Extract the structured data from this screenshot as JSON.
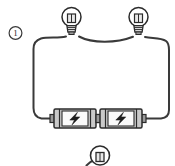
{
  "figure": {
    "kind": "circuit-diagram",
    "title": "",
    "item_number": "1",
    "background_color": "#ffffff",
    "wire_color": "#3a3a3a",
    "outline_color": "#2b2b2b",
    "body_fill": "#c9c9c9",
    "label_fill": "#f2f2f2",
    "cap_fill": "#9a9a9a"
  },
  "question_marker": {
    "label": "1",
    "shape": "circled-number"
  },
  "components": [
    {
      "id": "bulb-left",
      "type": "light-bulb",
      "icon": "light-bulb-icon",
      "label": "",
      "position": "top-left"
    },
    {
      "id": "bulb-right",
      "type": "light-bulb",
      "icon": "light-bulb-icon",
      "label": "",
      "position": "top-right"
    },
    {
      "id": "battery-left",
      "type": "battery",
      "icon": "battery-bolt-icon",
      "label": "",
      "position": "bottom-center-left"
    },
    {
      "id": "battery-right",
      "type": "battery",
      "icon": "battery-bolt-icon",
      "label": "",
      "position": "bottom-center-right"
    },
    {
      "id": "bulb-bottom-cropped",
      "type": "light-bulb",
      "icon": "light-bulb-icon",
      "label": "",
      "position": "bottom-edge-cropped"
    }
  ],
  "wires": {
    "count": 1,
    "description": "single closed loop"
  }
}
